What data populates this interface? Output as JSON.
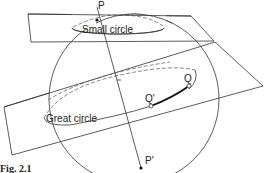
{
  "figure": {
    "caption": "Fig. 2.1",
    "labels": {
      "pole_north": "P",
      "pole_south": "P'",
      "small_circle": "Small circle",
      "great_circle": "Great circle",
      "point_q": "Q",
      "point_q_prime": "Q'"
    },
    "colors": {
      "line": "#333333",
      "dashed": "#666666",
      "background": "#ffffff"
    }
  }
}
